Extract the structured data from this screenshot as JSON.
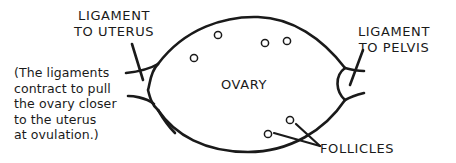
{
  "diagram": {
    "labels": {
      "ligament_uterus": [
        "LIGAMENT",
        "TO UTERUS"
      ],
      "ligament_pelvis": [
        "LIGAMENT",
        "TO PELVIS"
      ],
      "ovary": "OVARY",
      "follicles": "FOLLICLES"
    },
    "note": [
      "(The ligaments",
      "contract to pull",
      "the ovary closer",
      "to the uterus",
      "at ovulation.)"
    ],
    "colors": {
      "stroke": "#1a1a1a",
      "background": "#ffffff"
    }
  }
}
